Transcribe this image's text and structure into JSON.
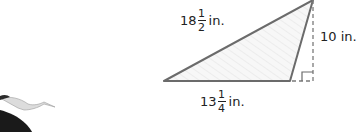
{
  "diagram": {
    "shape": "obtuse triangle with dashed height",
    "labels": {
      "hypotenuse": {
        "whole": "18",
        "num": "1",
        "den": "2",
        "unit": "in."
      },
      "height": {
        "text": "10 in."
      },
      "base": {
        "whole": "13",
        "num": "1",
        "den": "4",
        "unit": "in."
      }
    },
    "colors": {
      "stroke": "#6b6b6b",
      "fill": "#f4f4f4",
      "dash": "#7a7a7a",
      "text": "#222222"
    }
  },
  "decoration": {
    "image": "flying-stork"
  }
}
